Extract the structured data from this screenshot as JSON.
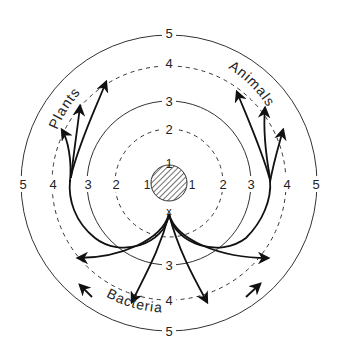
{
  "diagram": {
    "title": "",
    "center": {
      "x": 169,
      "y": 183
    },
    "core": {
      "label": "1",
      "radius": 18,
      "fill": "hatched"
    },
    "origin_marker": "x",
    "rings": [
      {
        "level": "1",
        "radius": 18,
        "style": "solid"
      },
      {
        "level": "2",
        "radius": 54,
        "style": "dashed"
      },
      {
        "level": "3",
        "radius": 82,
        "style": "solid"
      },
      {
        "level": "4",
        "radius": 117,
        "style": "dashed"
      },
      {
        "level": "5",
        "radius": 148,
        "style": "solid"
      }
    ],
    "ring_labels": {
      "core_top": "1",
      "core_left": "1",
      "core_right": "1",
      "l2_top": "2",
      "l2_left": "2",
      "l2_right": "2",
      "l3_top": "3",
      "l3_left": "3",
      "l3_right": "3",
      "l3_bottom": "3",
      "l4_top": "4",
      "l4_left": "4",
      "l4_right": "4",
      "l4_bottom": "4",
      "l5_top": "5",
      "l5_left": "5",
      "l5_right": "5",
      "l5_bottom": "5"
    },
    "groups": {
      "plants": "Plants",
      "animals": "Animals",
      "bacteria": "Bacteria"
    },
    "colors": {
      "line": "#222222",
      "background": "#ffffff"
    }
  }
}
